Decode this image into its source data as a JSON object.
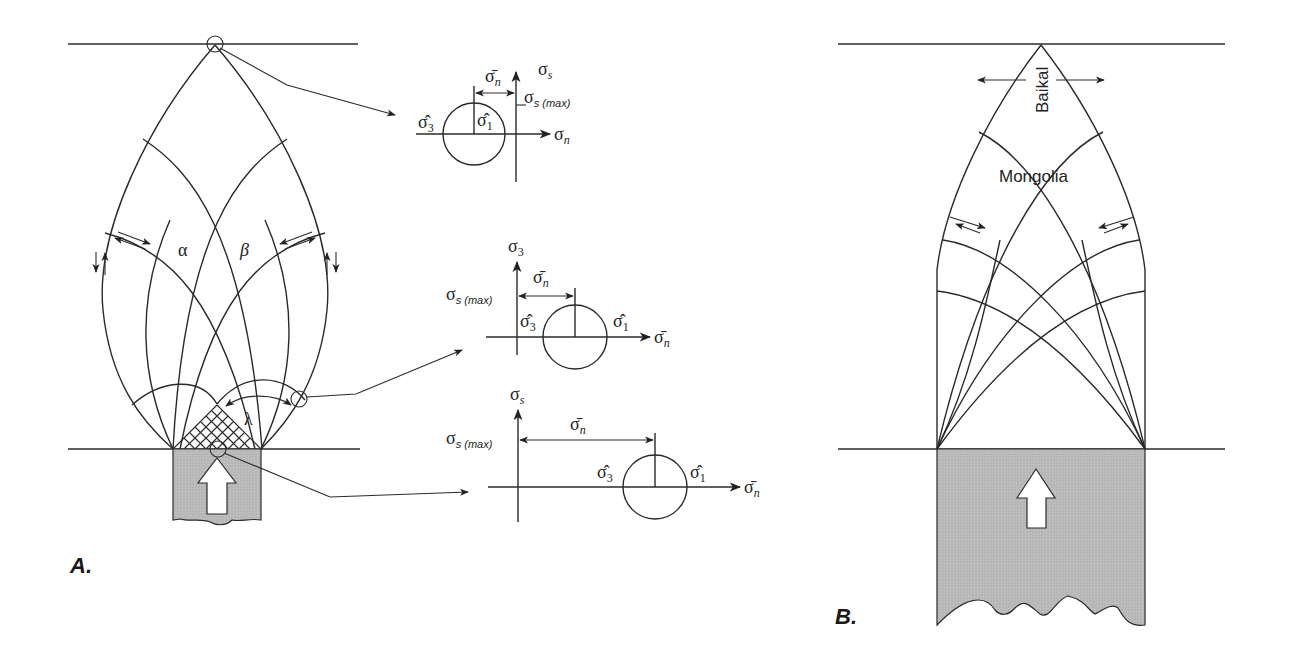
{
  "figure": {
    "panel_a": {
      "label": "A.",
      "angle_labels": {
        "alpha": "α",
        "beta": "β",
        "lambda": "λ"
      },
      "mohr_top": {
        "y_axis": "σ",
        "y_axis_sub": "s",
        "x_axis": "σ",
        "x_axis_sub": "n",
        "mean_label": "σ̄",
        "mean_sub": "n",
        "tau_max": "σ",
        "tau_max_sub": "s (max)",
        "s3": "σ̂",
        "s3_sub": "3",
        "s1": "σ̂",
        "s1_sub": "1"
      },
      "mohr_middle": {
        "y_axis": "σ",
        "y_axis_sub": "3",
        "x_axis": "σ̄",
        "x_axis_sub": "n",
        "mean_label": "σ̄",
        "mean_sub": "n",
        "tau_max": "σ",
        "tau_max_sub": "s (max)",
        "s3": "σ̂",
        "s3_sub": "3",
        "s1": "σ̂",
        "s1_sub": "1"
      },
      "mohr_bottom": {
        "y_axis": "σ",
        "y_axis_sub": "s",
        "x_axis": "σ̄",
        "x_axis_sub": "n",
        "mean_label": "σ̄",
        "mean_sub": "n",
        "tau_max": "σ",
        "tau_max_sub": "s (max)",
        "s3": "σ̂",
        "s3_sub": "3",
        "s1": "σ̂",
        "s1_sub": "1"
      }
    },
    "panel_b": {
      "label": "B.",
      "region_labels": {
        "baikal": "Baikal",
        "mongolia": "Mongolia"
      }
    },
    "colors": {
      "line": "#2a2a2a",
      "indenter_fill": "#b9b9b9",
      "background": "#ffffff"
    }
  }
}
